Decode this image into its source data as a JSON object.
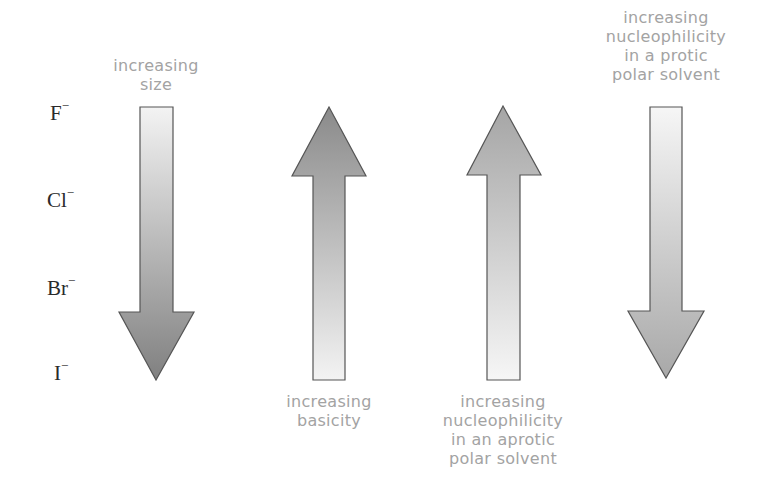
{
  "ions": [
    {
      "symbol": "F",
      "charge": "−"
    },
    {
      "symbol": "Cl",
      "charge": "−"
    },
    {
      "symbol": "Br",
      "charge": "−"
    },
    {
      "symbol": "I",
      "charge": "−"
    }
  ],
  "arrows": [
    {
      "direction": "down",
      "caption": "increasing\nsize",
      "caption_position": "top"
    },
    {
      "direction": "up",
      "caption": "increasing\nbasicity",
      "caption_position": "bottom"
    },
    {
      "direction": "up",
      "caption": "increasing\nnucleophilicity\nin an aprotic\npolar solvent",
      "caption_position": "bottom"
    },
    {
      "direction": "down",
      "caption": "increasing\nnucleophilicity\nin a protic\npolar solvent",
      "caption_position": "top"
    }
  ],
  "colors": {
    "caption_text": "#a3a3a3",
    "ion_text": "#2a2a2a",
    "arrow_dark": "#8a8a8a",
    "arrow_light": "#f2f2f2",
    "arrow_outline": "#555555"
  }
}
